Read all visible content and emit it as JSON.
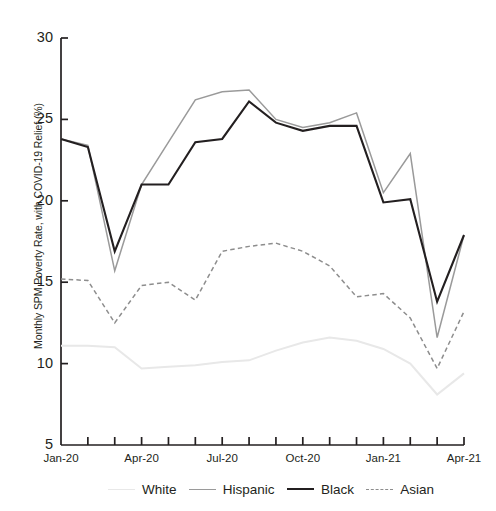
{
  "chart_data": {
    "type": "line",
    "title": "",
    "xlabel": "",
    "ylabel": "Monthly SPM Poverty Rate, with COVID-19 Relief (%)",
    "ylim": [
      5,
      30
    ],
    "ytick_values": [
      5,
      10,
      15,
      20,
      25,
      30
    ],
    "ytick_labels": [
      "5",
      "10",
      "15",
      "20",
      "25",
      "30"
    ],
    "grid": false,
    "legend_position": "bottom",
    "x": [
      "Jan-20",
      "Feb-20",
      "Mar-20",
      "Apr-20",
      "May-20",
      "Jun-20",
      "Jul-20",
      "Aug-20",
      "Sep-20",
      "Oct-20",
      "Nov-20",
      "Dec-20",
      "Jan-21",
      "Feb-21",
      "Mar-21",
      "Apr-21"
    ],
    "xtick_labels": [
      "Jan-20",
      "Apr-20",
      "Jul-20",
      "Oct-20",
      "Jan-21",
      "Apr-21"
    ],
    "xtick_label_indices": [
      0,
      3,
      6,
      9,
      12,
      15
    ],
    "series": [
      {
        "name": "White",
        "color": "#e8e8e8",
        "style": "solid",
        "values": [
          11.1,
          11.1,
          11.0,
          9.7,
          9.8,
          9.9,
          10.1,
          10.2,
          10.8,
          11.3,
          11.6,
          11.4,
          10.9,
          10.0,
          8.1,
          9.4
        ]
      },
      {
        "name": "Hispanic",
        "color": "#9a9a9a",
        "style": "solid",
        "values": [
          23.8,
          23.4,
          15.7,
          21.0,
          23.6,
          26.2,
          26.7,
          26.8,
          25.0,
          24.5,
          24.8,
          25.4,
          20.5,
          22.9,
          11.6,
          17.9
        ]
      },
      {
        "name": "Black",
        "color": "#231f20",
        "style": "solid",
        "values": [
          23.8,
          23.3,
          16.9,
          21.0,
          21.0,
          23.6,
          23.8,
          26.1,
          24.8,
          24.3,
          24.6,
          24.6,
          19.9,
          20.1,
          13.8,
          17.9
        ]
      },
      {
        "name": "Asian",
        "color": "#8d8d8d",
        "style": "dashed",
        "values": [
          15.2,
          15.1,
          12.5,
          14.8,
          15.0,
          13.9,
          16.9,
          17.2,
          17.4,
          16.9,
          16.0,
          14.1,
          14.3,
          12.8,
          9.7,
          13.2
        ]
      }
    ]
  },
  "legend": {
    "items": [
      {
        "label": "White"
      },
      {
        "label": "Hispanic"
      },
      {
        "label": "Black"
      },
      {
        "label": "Asian"
      }
    ]
  }
}
